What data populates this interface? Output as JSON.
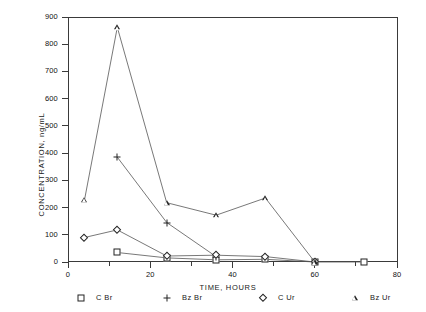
{
  "chart_data": {
    "type": "line",
    "title": "",
    "xlabel": "TIME, HOURS",
    "ylabel": "CONCENTRATION, ng/mL",
    "xlim": [
      0,
      80
    ],
    "ylim": [
      0,
      900
    ],
    "xticks": [
      0,
      20,
      40,
      60,
      80
    ],
    "xtick_labels": [
      "0",
      "20",
      "40",
      "60",
      "80"
    ],
    "xminor_ticks": [
      10,
      30,
      50,
      70
    ],
    "yticks": [
      0,
      100,
      200,
      300,
      400,
      500,
      600,
      700,
      800,
      900
    ],
    "ytick_labels": [
      "0",
      "100",
      "200",
      "300",
      "400",
      "500",
      "600",
      "700",
      "800",
      "900"
    ],
    "grid": false,
    "legend_position": "below-axis",
    "frame": "box",
    "series": [
      {
        "name": "C Br",
        "marker": "square",
        "x": [
          12,
          24,
          36,
          48,
          60,
          72
        ],
        "y": [
          35,
          15,
          8,
          10,
          0,
          0
        ]
      },
      {
        "name": "Bz Br",
        "marker": "plus",
        "x": [
          12,
          24,
          36
        ],
        "y": [
          385,
          145,
          20
        ]
      },
      {
        "name": "C Ur",
        "marker": "diamond",
        "x": [
          4,
          12,
          24,
          36,
          48,
          60
        ],
        "y": [
          90,
          118,
          22,
          25,
          20,
          0
        ]
      },
      {
        "name": "Bz Ur",
        "marker": "triangle",
        "x": [
          4,
          12,
          24,
          36,
          48,
          60
        ],
        "y": [
          228,
          862,
          218,
          172,
          235,
          0
        ]
      }
    ]
  },
  "legend": {
    "items": [
      {
        "marker": "square",
        "label": "C Br"
      },
      {
        "marker": "plus",
        "label": "Bz Br"
      },
      {
        "marker": "diamond",
        "label": "C Ur"
      },
      {
        "marker": "triangle",
        "label": "Bz Ur"
      }
    ]
  },
  "colors": {
    "axis": "#3a3a3a",
    "line": "#555555",
    "marker": "#222222",
    "background": "#ffffff",
    "text": "#111111"
  }
}
